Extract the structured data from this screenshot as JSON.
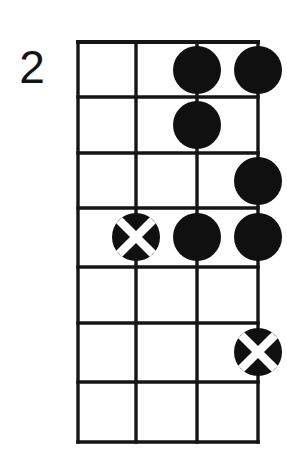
{
  "diagram": {
    "type": "fretboard-chord-diagram",
    "instrument_strings": 4,
    "fret_count": 7,
    "position_marker": "2",
    "colors": {
      "ink": "#101010",
      "background": "#ffffff",
      "marker_fill": "#101010",
      "marker_cross": "#ffffff"
    },
    "geometry": {
      "grid_left": 78,
      "grid_right": 258,
      "grid_top": 42,
      "grid_bottom": 442,
      "string_x": [
        78,
        136,
        197,
        258
      ],
      "fret_y": [
        42,
        97,
        153,
        208,
        267,
        323,
        382,
        442
      ],
      "dot_radius": 24
    },
    "strings": [
      {
        "index": 1,
        "label": "string-1",
        "x": 78
      },
      {
        "index": 2,
        "label": "string-2",
        "x": 136
      },
      {
        "index": 3,
        "label": "string-3",
        "x": 197
      },
      {
        "index": 4,
        "label": "string-4",
        "x": 258
      }
    ],
    "frets": [
      {
        "index": 1,
        "label": "fret-1",
        "y_top": 42,
        "y_bottom": 97,
        "center_y": 70
      },
      {
        "index": 2,
        "label": "fret-2",
        "y_top": 97,
        "y_bottom": 153,
        "center_y": 125
      },
      {
        "index": 3,
        "label": "fret-3",
        "y_top": 153,
        "y_bottom": 208,
        "center_y": 181
      },
      {
        "index": 4,
        "label": "fret-4",
        "y_top": 208,
        "y_bottom": 267,
        "center_y": 237
      },
      {
        "index": 5,
        "label": "fret-5",
        "y_top": 267,
        "y_bottom": 323,
        "center_y": 295
      },
      {
        "index": 6,
        "label": "fret-6",
        "y_top": 323,
        "y_bottom": 382,
        "center_y": 352
      },
      {
        "index": 7,
        "label": "fret-7",
        "y_top": 382,
        "y_bottom": 442,
        "center_y": 412
      }
    ],
    "markers": [
      {
        "id": "m1",
        "string": 3,
        "fret": 1,
        "style": "filled",
        "cx": 197,
        "cy": 70,
        "r": 24
      },
      {
        "id": "m2",
        "string": 4,
        "fret": 1,
        "style": "filled",
        "cx": 258,
        "cy": 70,
        "r": 24
      },
      {
        "id": "m3",
        "string": 3,
        "fret": 2,
        "style": "filled",
        "cx": 197,
        "cy": 125,
        "r": 24
      },
      {
        "id": "m4",
        "string": 4,
        "fret": 3,
        "style": "filled",
        "cx": 258,
        "cy": 181,
        "r": 24
      },
      {
        "id": "m5",
        "string": 2,
        "fret": 4,
        "style": "cross",
        "cx": 136,
        "cy": 237,
        "r": 24
      },
      {
        "id": "m6",
        "string": 3,
        "fret": 4,
        "style": "filled",
        "cx": 197,
        "cy": 237,
        "r": 24
      },
      {
        "id": "m7",
        "string": 4,
        "fret": 4,
        "style": "filled",
        "cx": 258,
        "cy": 237,
        "r": 24
      },
      {
        "id": "m8",
        "string": 4,
        "fret": 6,
        "style": "cross",
        "cx": 258,
        "cy": 352,
        "r": 24
      }
    ]
  }
}
